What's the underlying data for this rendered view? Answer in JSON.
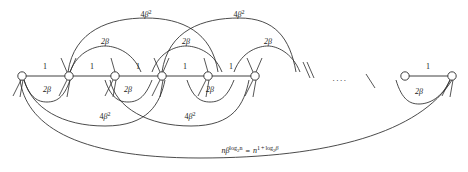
{
  "figure": {
    "stroke_color": "#2b2b2b",
    "node_fill": "#ffffff",
    "background": "#ffffff",
    "node_radius": 4.2,
    "baseline_y": 76,
    "nodes": [
      {
        "id": "n1",
        "x": 22,
        "y": 76
      },
      {
        "id": "n2",
        "x": 69,
        "y": 76
      },
      {
        "id": "n3",
        "x": 115,
        "y": 76
      },
      {
        "id": "n4",
        "x": 162,
        "y": 76
      },
      {
        "id": "n5",
        "x": 208,
        "y": 76
      },
      {
        "id": "n6",
        "x": 255,
        "y": 76
      },
      {
        "id": "n7",
        "x": 405,
        "y": 76
      },
      {
        "id": "n8",
        "x": 452,
        "y": 76
      }
    ],
    "ellipsis": {
      "text": "....",
      "x": 340,
      "y": 78
    },
    "edge_labels_spine": [
      {
        "text": "1",
        "x": 45,
        "y": 67
      },
      {
        "text": "1",
        "x": 92,
        "y": 67
      },
      {
        "text": "1",
        "x": 138,
        "y": 67
      },
      {
        "text": "1",
        "x": 185,
        "y": 67
      },
      {
        "text": "1",
        "x": 231,
        "y": 67
      },
      {
        "text": "1",
        "x": 428,
        "y": 67
      }
    ],
    "labels_top_beta": [
      {
        "text": "2β",
        "x": 105,
        "y": 42
      },
      {
        "text": "2β",
        "x": 186,
        "y": 42
      },
      {
        "text": "2β",
        "x": 268,
        "y": 42
      }
    ],
    "labels_top_beta2": [
      {
        "coef": "4",
        "base": "β",
        "exp": "2",
        "x": 146,
        "y": 14
      },
      {
        "coef": "4",
        "base": "β",
        "exp": "2",
        "x": 239,
        "y": 14
      }
    ],
    "labels_bottom_beta": [
      {
        "text": "2β",
        "x": 47,
        "y": 90
      },
      {
        "text": "2β",
        "x": 128,
        "y": 90
      },
      {
        "text": "2β",
        "x": 210,
        "y": 90
      },
      {
        "text": "2β",
        "x": 419,
        "y": 92
      }
    ],
    "labels_bottom_beta2": [
      {
        "coef": "4",
        "base": "β",
        "exp": "2",
        "x": 105,
        "y": 116
      },
      {
        "coef": "4",
        "base": "β",
        "exp": "2",
        "x": 190,
        "y": 116
      }
    ],
    "formula": {
      "x": 250,
      "y": 150,
      "lhs_coef": "n",
      "lhs_base": "β",
      "lhs_exp_log": "log",
      "lhs_exp_sub": "2",
      "lhs_exp_arg": "n",
      "equals": "=",
      "rhs_base": "n",
      "rhs_exp_one": "1",
      "rhs_exp_plus": "+",
      "rhs_exp_log": "log",
      "rhs_exp_sub": "2",
      "rhs_exp_beta": "β"
    }
  }
}
